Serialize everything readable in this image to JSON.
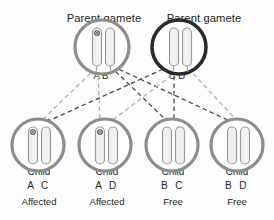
{
  "figure": {
    "background_color": "#fdfdfd",
    "ink_color": "#231f20"
  },
  "colors": {
    "parent_left_ring": "#8d8d8d",
    "parent_right_ring": "#2b2b2b",
    "child_ring": "#8d8d8d",
    "chromosome_stroke": "#9a9a9a",
    "chromosome_fill": "#f0f0ee",
    "mutation_dot": "#4a4a4a",
    "line_light": "#b3b3b3",
    "line_dark": "#3d3d3d"
  },
  "parents": [
    {
      "id": "parent-left",
      "label": "Parent gamete",
      "ring_style": "light",
      "chromosomes": [
        {
          "allele": "A",
          "mutated": true
        },
        {
          "allele": "B",
          "mutated": false
        }
      ],
      "allele_labels": "A  B"
    },
    {
      "id": "parent-right",
      "label": "Parent gamete",
      "ring_style": "dark",
      "chromosomes": [
        {
          "allele": "C",
          "mutated": false
        },
        {
          "allele": "D",
          "mutated": false
        }
      ],
      "allele_labels": "C D"
    }
  ],
  "children": [
    {
      "id": "child-1",
      "title": "Child",
      "alleles": "A C",
      "status": "Affected",
      "chromosomes": [
        {
          "allele": "A",
          "mutated": true
        },
        {
          "allele": "C",
          "mutated": false
        }
      ]
    },
    {
      "id": "child-2",
      "title": "Child",
      "alleles": "A D",
      "status": "Affected",
      "chromosomes": [
        {
          "allele": "A",
          "mutated": true
        },
        {
          "allele": "D",
          "mutated": false
        }
      ]
    },
    {
      "id": "child-3",
      "title": "Child",
      "alleles": "B C",
      "status": "Free",
      "chromosomes": [
        {
          "allele": "B",
          "mutated": false
        },
        {
          "allele": "C",
          "mutated": false
        }
      ]
    },
    {
      "id": "child-4",
      "title": "Child",
      "alleles": "B D",
      "status": "Free",
      "chromosomes": [
        {
          "allele": "B",
          "mutated": false
        },
        {
          "allele": "D",
          "mutated": false
        }
      ]
    }
  ],
  "connections": [
    {
      "from": "A",
      "to": "child-1",
      "style": "light"
    },
    {
      "from": "A",
      "to": "child-2",
      "style": "light"
    },
    {
      "from": "B",
      "to": "child-3",
      "style": "dark"
    },
    {
      "from": "B",
      "to": "child-4",
      "style": "dark"
    },
    {
      "from": "C",
      "to": "child-1",
      "style": "dark"
    },
    {
      "from": "C",
      "to": "child-3",
      "style": "dark"
    },
    {
      "from": "D",
      "to": "child-2",
      "style": "light"
    },
    {
      "from": "D",
      "to": "child-4",
      "style": "light"
    }
  ]
}
